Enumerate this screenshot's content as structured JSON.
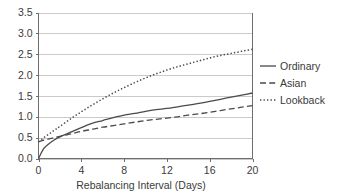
{
  "chart_data": {
    "type": "line",
    "title": "",
    "xlabel": "Rebalancing Interval (Days)",
    "ylabel": "",
    "xlim": [
      0,
      20
    ],
    "ylim": [
      0,
      3.5
    ],
    "grid": true,
    "legend_position": "right",
    "xticks": [
      "0",
      "4",
      "8",
      "12",
      "16",
      "20"
    ],
    "xtick_values": [
      0,
      4,
      8,
      12,
      16,
      20
    ],
    "yticks": [
      "0.0",
      "0.5",
      "1.0",
      "1.5",
      "2.0",
      "2.5",
      "3.0",
      "3.5"
    ],
    "ytick_values": [
      0.0,
      0.5,
      1.0,
      1.5,
      2.0,
      2.5,
      3.0,
      3.5
    ],
    "x": [
      0,
      0.5,
      1,
      1.5,
      2,
      3,
      4,
      5,
      6,
      7,
      8,
      9,
      10,
      11,
      12,
      13,
      14,
      15,
      16,
      17,
      18,
      19,
      20
    ],
    "series": [
      {
        "name": "Ordinary",
        "style": "solid",
        "color": "#4a4a4a",
        "values": [
          0.0,
          0.24,
          0.36,
          0.45,
          0.52,
          0.63,
          0.74,
          0.84,
          0.91,
          0.98,
          1.04,
          1.08,
          1.13,
          1.17,
          1.2,
          1.24,
          1.28,
          1.32,
          1.37,
          1.42,
          1.47,
          1.52,
          1.57
        ]
      },
      {
        "name": "Asian",
        "style": "dashed",
        "color": "#4a4a4a",
        "values": [
          0.4,
          0.44,
          0.47,
          0.5,
          0.53,
          0.59,
          0.65,
          0.7,
          0.75,
          0.79,
          0.83,
          0.87,
          0.91,
          0.94,
          0.97,
          1.0,
          1.04,
          1.07,
          1.11,
          1.15,
          1.19,
          1.23,
          1.27
        ]
      },
      {
        "name": "Lookback",
        "style": "dotted",
        "color": "#4a4a4a",
        "values": [
          0.4,
          0.5,
          0.59,
          0.68,
          0.77,
          0.95,
          1.12,
          1.28,
          1.43,
          1.57,
          1.7,
          1.82,
          1.93,
          2.03,
          2.12,
          2.2,
          2.27,
          2.34,
          2.41,
          2.47,
          2.52,
          2.57,
          2.62
        ]
      }
    ]
  },
  "legend": {
    "entries": [
      {
        "label": "Ordinary"
      },
      {
        "label": "Asian"
      },
      {
        "label": "Lookback"
      }
    ]
  }
}
